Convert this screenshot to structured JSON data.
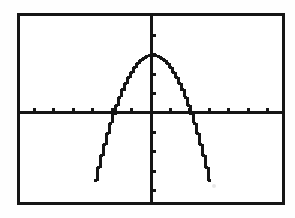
{
  "screen": {
    "title": "Graphing Calculator Viewport",
    "device": "graphing-calculator",
    "background_color": "#ffffff",
    "ink_color": "#151515",
    "frame": {
      "border_color": "#151515",
      "border_width_px": 3,
      "left_px": 17,
      "top_px": 13,
      "width_px": 268,
      "height_px": 192
    }
  },
  "chart_data": {
    "type": "line",
    "title": "",
    "subtitle": "",
    "xlabel": "",
    "ylabel": "",
    "render_style": "pixelated-calculator-trace",
    "grid": false,
    "legend": null,
    "axes": {
      "x_axis": {
        "visible": true,
        "position_value": 0,
        "range": [
          -6.75,
          6.75
        ],
        "tick_step": 1,
        "tick_labels_shown": false,
        "tick_values": [
          -6,
          -5,
          -4,
          -3,
          -2,
          -1,
          1,
          2,
          3,
          4,
          5,
          6
        ],
        "axis_line_color": "#151515",
        "axis_line_width_px": 3,
        "tick_length_px": 5
      },
      "y_axis": {
        "visible": true,
        "position_value": 0,
        "range": [
          -4.6,
          5.0
        ],
        "tick_step": 1,
        "tick_labels_shown": false,
        "tick_values": [
          -4,
          -3,
          -2,
          -1,
          1,
          2,
          3,
          4
        ],
        "axis_line_color": "#151515",
        "axis_line_width_px": 3,
        "tick_length_px": 5
      }
    },
    "series": [
      {
        "name": "parabola",
        "equation": "y = -0.75x^2 + 3",
        "shape": "downward-opening parabola",
        "color": "#151515",
        "line_width_px": 3,
        "vertex": [
          0,
          3
        ],
        "roots": [
          -2,
          2
        ],
        "y_intercept": 3,
        "domain_drawn": [
          -2.95,
          2.95
        ],
        "clipped_at_y": -3.5,
        "x": [
          -2.95,
          -2.8,
          -2.6,
          -2.4,
          -2.2,
          -2.0,
          -1.8,
          -1.6,
          -1.4,
          -1.2,
          -1.0,
          -0.8,
          -0.6,
          -0.4,
          -0.2,
          0,
          0.2,
          0.4,
          0.6,
          0.8,
          1.0,
          1.2,
          1.4,
          1.6,
          1.8,
          2.0,
          2.2,
          2.4,
          2.6,
          2.8,
          2.95
        ],
        "y": [
          -3.53,
          -2.88,
          -2.07,
          -1.32,
          -0.63,
          0,
          0.57,
          1.08,
          1.53,
          1.92,
          2.25,
          2.52,
          2.73,
          2.88,
          2.97,
          3.0,
          2.97,
          2.88,
          2.73,
          2.52,
          2.25,
          1.92,
          1.53,
          1.08,
          0.57,
          0,
          -0.63,
          -1.32,
          -2.07,
          -2.88,
          -3.53
        ]
      }
    ]
  }
}
